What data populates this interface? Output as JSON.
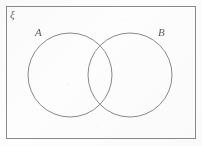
{
  "figure": {
    "kind": "venn-diagram",
    "background_color": "#fdfdfd",
    "stroke_color": "#8a8a8a",
    "label_color": "#5d5d5d"
  },
  "universal_set": {
    "label": "ξ",
    "shape": "rectangle",
    "x": 6,
    "y": 6,
    "width": 190,
    "height": 133,
    "stroke_width": 1
  },
  "sets": [
    {
      "label": "A",
      "shape": "circle",
      "cx": 70,
      "cy": 75,
      "r": 42,
      "stroke_width": 1,
      "fill": "none",
      "label_x": 35,
      "label_y": 27
    },
    {
      "label": "B",
      "shape": "circle",
      "cx": 130,
      "cy": 75,
      "r": 42,
      "stroke_width": 1,
      "fill": "none",
      "label_x": 158,
      "label_y": 27
    }
  ],
  "regions": {
    "intersection_filled": false,
    "shading": "none"
  }
}
